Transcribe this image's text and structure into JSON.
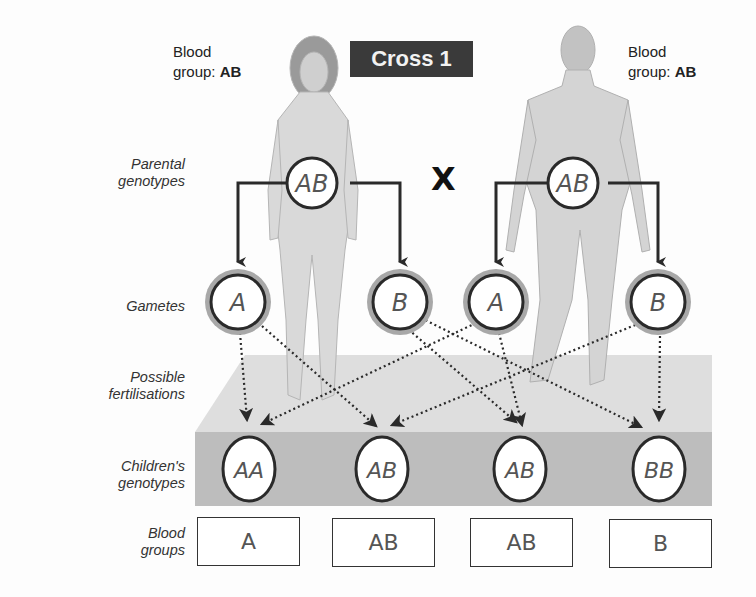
{
  "title": "Cross 1",
  "cross_symbol": "X",
  "parents": {
    "mother": {
      "label_line1": "Blood",
      "label_line2_prefix": "group: ",
      "blood_group": "AB",
      "genotype": "AB"
    },
    "father": {
      "label_line1": "Blood",
      "label_line2_prefix": "group: ",
      "blood_group": "AB",
      "genotype": "AB"
    }
  },
  "row_labels": {
    "parental": [
      "Parental",
      "genotypes"
    ],
    "gametes": [
      "Gametes"
    ],
    "fertilisations": [
      "Possible",
      "fertilisations"
    ],
    "children": [
      "Children's",
      "genotypes"
    ],
    "blood_groups": [
      "Blood",
      "groups"
    ]
  },
  "gametes": [
    {
      "parent": "mother",
      "allele": "A"
    },
    {
      "parent": "mother",
      "allele": "B"
    },
    {
      "parent": "father",
      "allele": "A"
    },
    {
      "parent": "father",
      "allele": "B"
    }
  ],
  "children": [
    {
      "genotype": "AA",
      "blood_group": "A"
    },
    {
      "genotype": "AB",
      "blood_group": "AB"
    },
    {
      "genotype": "AB",
      "blood_group": "AB"
    },
    {
      "genotype": "BB",
      "blood_group": "B"
    }
  ],
  "colors": {
    "title_bg": "#3a3a3a",
    "title_text": "#f2f2f2",
    "gamete_ring": "#a8a8a8",
    "platform_top": "#dcdcdc",
    "platform_front": "#bdbdbd",
    "line": "#2a2a2a"
  }
}
